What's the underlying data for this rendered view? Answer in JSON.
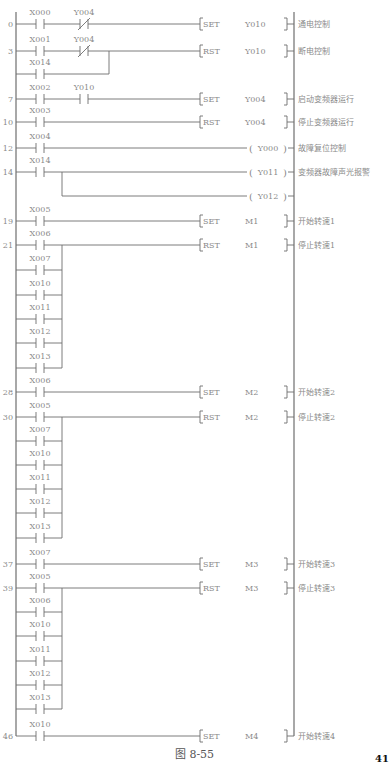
{
  "figure": {
    "caption": "图 8-55",
    "page_number": "41",
    "left_rail_x": 16,
    "right_rail_x": 294,
    "rail_top": 12,
    "rail_bottom": 736
  },
  "rungs": [
    {
      "step": "0",
      "y": 24,
      "contacts": [
        {
          "label": "X000",
          "type": "NO",
          "x": 40
        },
        {
          "label": "Y004",
          "type": "NC",
          "x": 84
        }
      ],
      "instruction": {
        "op": "SET",
        "operand": "Y010",
        "kind": "func"
      },
      "comment": "通电控制"
    },
    {
      "step": "3",
      "y": 51,
      "contacts": [
        {
          "label": "X001",
          "type": "NO",
          "x": 40
        },
        {
          "label": "Y004",
          "type": "NC",
          "x": 84
        }
      ],
      "branches": [
        {
          "label": "X014",
          "y": 74,
          "join_x": 109
        }
      ],
      "instruction": {
        "op": "RST",
        "operand": "Y010",
        "kind": "func"
      },
      "comment": "断电控制"
    },
    {
      "step": "7",
      "y": 99,
      "contacts": [
        {
          "label": "X002",
          "type": "NO",
          "x": 40
        },
        {
          "label": "Y010",
          "type": "NO",
          "x": 84
        }
      ],
      "instruction": {
        "op": "SET",
        "operand": "Y004",
        "kind": "func"
      },
      "comment": "启动变频器运行"
    },
    {
      "step": "10",
      "y": 122,
      "contacts": [
        {
          "label": "X003",
          "type": "NO",
          "x": 40
        }
      ],
      "instruction": {
        "op": "RST",
        "operand": "Y004",
        "kind": "func"
      },
      "comment": "停止变频器运行"
    },
    {
      "step": "12",
      "y": 148,
      "contacts": [
        {
          "label": "X004",
          "type": "NO",
          "x": 40
        }
      ],
      "instruction": {
        "op": "",
        "operand": "Y000",
        "kind": "coil"
      },
      "comment": "故障复位控制"
    },
    {
      "step": "14",
      "y": 172,
      "contacts": [
        {
          "label": "X014",
          "type": "NO",
          "x": 40
        }
      ],
      "instruction": {
        "op": "",
        "operand": "Y011",
        "kind": "coil"
      },
      "comment": "变频器故障声光报警",
      "parallel_coil": {
        "operand": "Y012",
        "y": 196,
        "split_x": 62
      }
    },
    {
      "step": "19",
      "y": 221,
      "contacts": [
        {
          "label": "X005",
          "type": "NO",
          "x": 40
        }
      ],
      "instruction": {
        "op": "SET",
        "operand": "M1",
        "kind": "func"
      },
      "comment": "开始转速1"
    },
    {
      "step": "21",
      "y": 245,
      "contacts": [
        {
          "label": "X006",
          "type": "NO",
          "x": 40
        }
      ],
      "branches": [
        {
          "label": "X007",
          "y": 270,
          "join_x": 62
        },
        {
          "label": "X010",
          "y": 295,
          "join_x": 62
        },
        {
          "label": "X011",
          "y": 319,
          "join_x": 62
        },
        {
          "label": "X012",
          "y": 343,
          "join_x": 62
        },
        {
          "label": "X013",
          "y": 368,
          "join_x": 62
        }
      ],
      "instruction": {
        "op": "RST",
        "operand": "M1",
        "kind": "func"
      },
      "comment": "停止转速1"
    },
    {
      "step": "28",
      "y": 392,
      "contacts": [
        {
          "label": "X006",
          "type": "NO",
          "x": 40
        }
      ],
      "instruction": {
        "op": "SET",
        "operand": "M2",
        "kind": "func"
      },
      "comment": "开始转速2"
    },
    {
      "step": "30",
      "y": 417,
      "contacts": [
        {
          "label": "X005",
          "type": "NO",
          "x": 40
        }
      ],
      "branches": [
        {
          "label": "X007",
          "y": 441,
          "join_x": 62
        },
        {
          "label": "X010",
          "y": 465,
          "join_x": 62
        },
        {
          "label": "X011",
          "y": 489,
          "join_x": 62
        },
        {
          "label": "X012",
          "y": 513,
          "join_x": 62
        },
        {
          "label": "X013",
          "y": 538,
          "join_x": 62
        }
      ],
      "instruction": {
        "op": "RST",
        "operand": "M2",
        "kind": "func"
      },
      "comment": "停止转速2"
    },
    {
      "step": "37",
      "y": 564,
      "contacts": [
        {
          "label": "X007",
          "type": "NO",
          "x": 40
        }
      ],
      "instruction": {
        "op": "SET",
        "operand": "M3",
        "kind": "func"
      },
      "comment": "开始转速3"
    },
    {
      "step": "39",
      "y": 588,
      "contacts": [
        {
          "label": "X005",
          "type": "NO",
          "x": 40
        }
      ],
      "branches": [
        {
          "label": "X006",
          "y": 612,
          "join_x": 62
        },
        {
          "label": "X010",
          "y": 636,
          "join_x": 62
        },
        {
          "label": "X011",
          "y": 661,
          "join_x": 62
        },
        {
          "label": "X012",
          "y": 685,
          "join_x": 62
        },
        {
          "label": "X013",
          "y": 709,
          "join_x": 62
        }
      ],
      "instruction": {
        "op": "RST",
        "operand": "M3",
        "kind": "func"
      },
      "comment": "停止转速3"
    },
    {
      "step": "46",
      "y": 736,
      "contacts": [
        {
          "label": "X010",
          "type": "NO",
          "x": 40
        }
      ],
      "instruction": {
        "op": "SET",
        "operand": "M4",
        "kind": "func"
      },
      "comment": "开始转速4"
    }
  ],
  "colors": {
    "line": "#6e6e6e",
    "text": "#8a8a8a",
    "rail": "#444444"
  }
}
